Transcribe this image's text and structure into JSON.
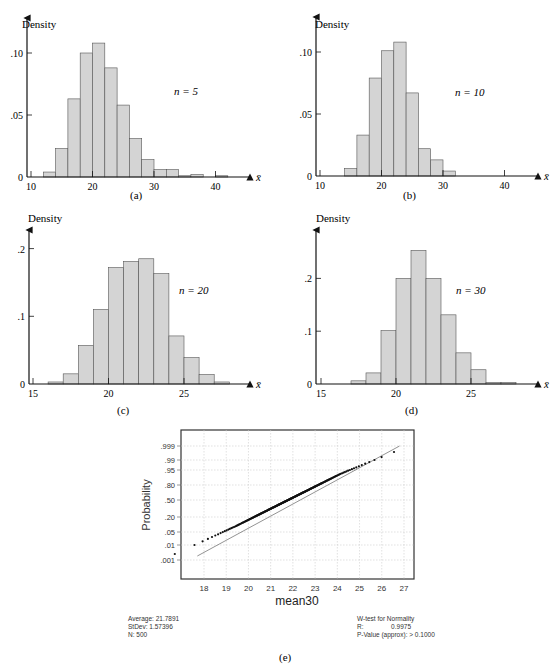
{
  "chart_data": [
    {
      "type": "bar",
      "panel": "(a)",
      "title": "",
      "annotation": "n = 5",
      "ylabel": "Density",
      "xlabel": "x̄",
      "xticks": [
        10,
        20,
        30,
        40
      ],
      "yticks": [
        {
          "v": 0,
          "label": "0"
        },
        {
          "v": 0.05,
          "label": ".05"
        },
        {
          "v": 0.1,
          "label": ".10"
        }
      ],
      "xlim": [
        10,
        44
      ],
      "ylim": [
        0,
        0.13
      ],
      "bin_width": 2,
      "bins": [
        12,
        14,
        16,
        18,
        20,
        22,
        24,
        26,
        28,
        30,
        32,
        34,
        36,
        38,
        40
      ],
      "values": [
        0.004,
        0.023,
        0.063,
        0.1,
        0.108,
        0.088,
        0.058,
        0.031,
        0.014,
        0.006,
        0.006,
        0.001,
        0.002,
        0.0,
        0.001
      ]
    },
    {
      "type": "bar",
      "panel": "(b)",
      "annotation": "n = 10",
      "ylabel": "Density",
      "xlabel": "x̄",
      "xticks": [
        10,
        20,
        30,
        40
      ],
      "yticks": [
        {
          "v": 0,
          "label": "0"
        },
        {
          "v": 0.05,
          "label": ".05"
        },
        {
          "v": 0.1,
          "label": ".10"
        }
      ],
      "xlim": [
        10,
        44
      ],
      "ylim": [
        0,
        0.13
      ],
      "bin_width": 2,
      "bins": [
        14,
        16,
        18,
        20,
        22,
        24,
        26,
        28,
        30
      ],
      "values": [
        0.006,
        0.033,
        0.079,
        0.101,
        0.108,
        0.067,
        0.022,
        0.013,
        0.004
      ]
    },
    {
      "type": "bar",
      "panel": "(c)",
      "annotation": "n = 20",
      "ylabel": "Density",
      "xlabel": "x̄",
      "xticks": [
        15,
        20,
        25
      ],
      "yticks": [
        {
          "v": 0,
          "label": "0"
        },
        {
          "v": 0.1,
          "label": ".1"
        },
        {
          "v": 0.2,
          "label": ".2"
        }
      ],
      "xlim": [
        15,
        29
      ],
      "ylim": [
        0,
        0.26
      ],
      "bin_width": 1,
      "bins": [
        16,
        17,
        18,
        19,
        20,
        21,
        22,
        23,
        24,
        25,
        26,
        27
      ],
      "values": [
        0.003,
        0.015,
        0.057,
        0.11,
        0.172,
        0.181,
        0.185,
        0.163,
        0.071,
        0.039,
        0.014,
        0.003
      ]
    },
    {
      "type": "bar",
      "panel": "(d)",
      "annotation": "n = 30",
      "ylabel": "Density",
      "xlabel": "x̄",
      "xticks": [
        15,
        20,
        25
      ],
      "yticks": [
        {
          "v": 0,
          "label": "0"
        },
        {
          "v": 0.1,
          "label": ".1"
        },
        {
          "v": 0.2,
          "label": ".2"
        }
      ],
      "xlim": [
        15,
        29
      ],
      "ylim": [
        0,
        0.29
      ],
      "bin_width": 1,
      "bins": [
        17,
        18,
        19,
        20,
        21,
        22,
        23,
        24,
        25,
        26,
        27
      ],
      "values": [
        0.006,
        0.021,
        0.101,
        0.2,
        0.253,
        0.2,
        0.131,
        0.059,
        0.027,
        0.003,
        0.003
      ]
    },
    {
      "type": "scatter",
      "panel": "(e)",
      "title": "Normal probability plot",
      "xlabel": "mean30",
      "ylabel": "Probability",
      "xticks": [
        18,
        19,
        20,
        21,
        22,
        23,
        24,
        25,
        26,
        27
      ],
      "yticks": [
        ".001",
        ".01",
        ".05",
        ".20",
        ".50",
        ".80",
        ".95",
        ".99",
        ".999"
      ],
      "grid": true,
      "fit_line": {
        "from": [
          17.7,
          0.004
        ],
        "to": [
          26.8,
          0.999
        ]
      },
      "stats_left": [
        "Average: 21.7891",
        "StDev: 1.57396",
        "N: 500"
      ],
      "stats_right": {
        "title": "W-test for Normality",
        "R_label": "R:",
        "R_value": "0.9975",
        "p_value": "P-Value (approx): > 0.1000"
      }
    }
  ],
  "captions": {
    "a": "(a)",
    "b": "(b)",
    "c": "(c)",
    "d": "(d)",
    "e": "(e)"
  },
  "colors": {
    "bar_fill": "#d4d4d4",
    "bar_stroke": "#555555",
    "axis": "#111111",
    "grid": "#cccccc",
    "points": "#111111"
  }
}
